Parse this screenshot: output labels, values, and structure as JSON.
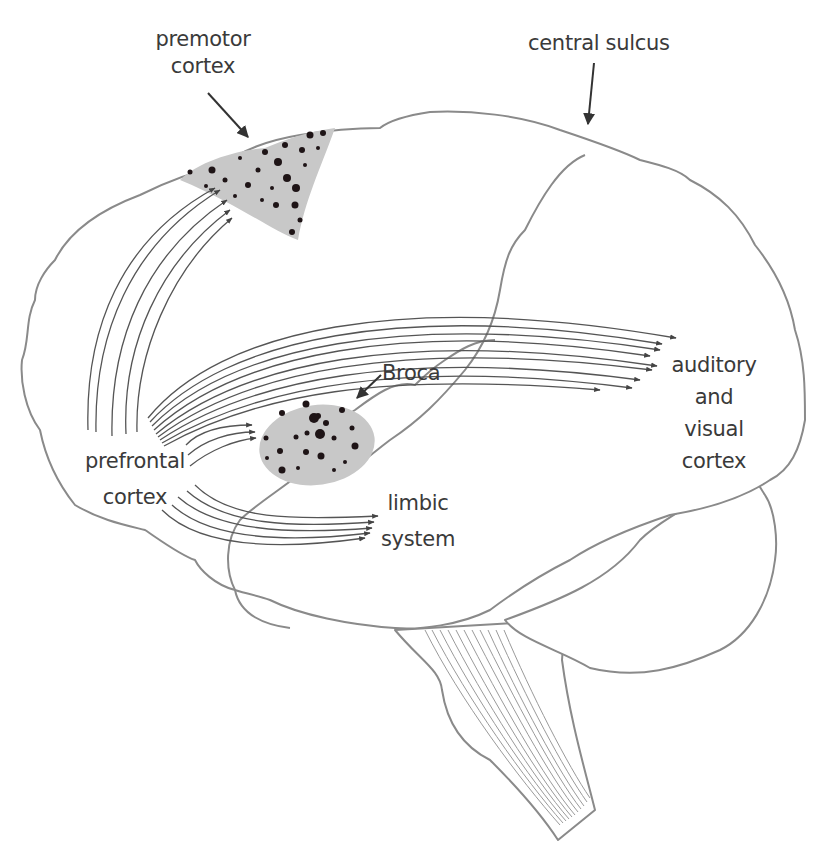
{
  "diagram": {
    "colors": {
      "outline": "#8a8a8a",
      "fibers": "#555555",
      "region_fill": "#c8c8c8",
      "region_dots": "#1e1416",
      "label_text": "#3a3a3a"
    },
    "labels": {
      "premotor_line1": "premotor",
      "premotor_line2": "cortex",
      "central_sulcus": "central sulcus",
      "broca": "Broca",
      "auditory_line1": "auditory",
      "auditory_line2": "and",
      "auditory_line3": "visual",
      "auditory_line4": "cortex",
      "prefrontal_line1": "prefrontal",
      "prefrontal_line2": "cortex",
      "limbic_line1": "limbic",
      "limbic_line2": "system"
    },
    "regions": [
      {
        "name": "premotor cortex",
        "shading": "dotted gray"
      },
      {
        "name": "Broca area",
        "shading": "dotted gray"
      }
    ],
    "projections": [
      {
        "from": "prefrontal cortex",
        "to": "premotor cortex",
        "fiber_count": 5
      },
      {
        "from": "prefrontal cortex",
        "to": "auditory and visual cortex",
        "fiber_count": 9
      },
      {
        "from": "prefrontal cortex",
        "to": "Broca",
        "fiber_count": 3
      },
      {
        "from": "prefrontal cortex",
        "to": "limbic system",
        "fiber_count": 5
      }
    ]
  }
}
